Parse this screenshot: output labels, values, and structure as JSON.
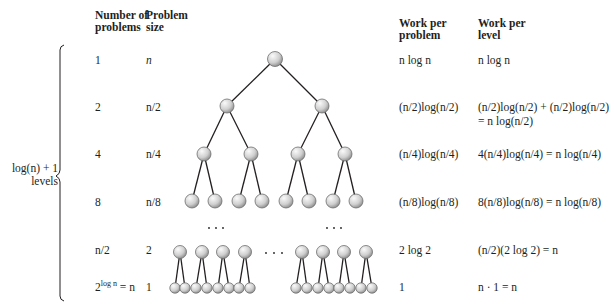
{
  "headers": {
    "num_problems_1": "Number of",
    "num_problems_2": "problems",
    "prob_size_1": "Problem",
    "prob_size_2": "size",
    "work_problem_1": "Work per",
    "work_problem_2": "problem",
    "work_level_1": "Work per",
    "work_level_2": "level"
  },
  "brace": {
    "label_line1": "log(n) + 1",
    "label_line2": "levels"
  },
  "rows": [
    {
      "num": "1",
      "size": "n",
      "work_problem": "n log n",
      "work_level": "n log n"
    },
    {
      "num": "2",
      "size": "n/2",
      "work_problem": "(n/2)log(n/2)",
      "work_level": "(n/2)log(n/2) + (n/2)log(n/2)",
      "work_level_2": "= n log(n/2)"
    },
    {
      "num": "4",
      "size": "n/4",
      "work_problem": "(n/4)log(n/4)",
      "work_level": "4(n/4)log(n/4) = n log(n/4)"
    },
    {
      "num": "8",
      "size": "n/8",
      "work_problem": "(n/8)log(n/8)",
      "work_level": "8(n/8)log(n/8) = n log(n/8)"
    },
    {
      "num": "n/2",
      "size": "2",
      "work_problem": "2 log 2",
      "work_level": "(n/2)(2 log 2) = n"
    },
    {
      "num_base": "2",
      "num_exp": "log n",
      "num_rest": " = n",
      "size": "1",
      "work_problem": "1",
      "work_level": "n · 1 = n"
    }
  ],
  "ellipsis": "· · ·",
  "colors": {
    "node_light": "#f2f2f2",
    "node_dark": "#9a9a9a",
    "edge": "#231f20",
    "text": "#231f20"
  }
}
